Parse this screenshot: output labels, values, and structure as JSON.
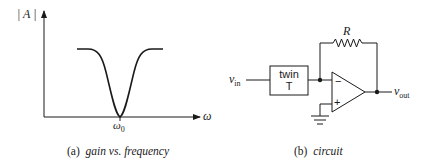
{
  "panel_a": {
    "y_axis_label": "| A |",
    "x_axis_label": "ω",
    "tick_label_main": "ω",
    "tick_label_sub": "0",
    "caption_prefix": "(a)",
    "caption_text": "gain vs. frequency",
    "curve": {
      "type": "notch",
      "description": "gain magnitude flat at high level, dipping to zero at ω0"
    }
  },
  "panel_b": {
    "input_label_main": "v",
    "input_label_sub": "in",
    "block_line1": "twin",
    "block_line2": "T",
    "resistor_label": "R",
    "opamp_inverting": "−",
    "opamp_noninverting": "+",
    "output_label_main": "v",
    "output_label_sub": "out",
    "caption_prefix": "(b)",
    "caption_text": "circuit"
  },
  "colors": {
    "ink": "#1a1a1a",
    "background": "#ffffff"
  }
}
